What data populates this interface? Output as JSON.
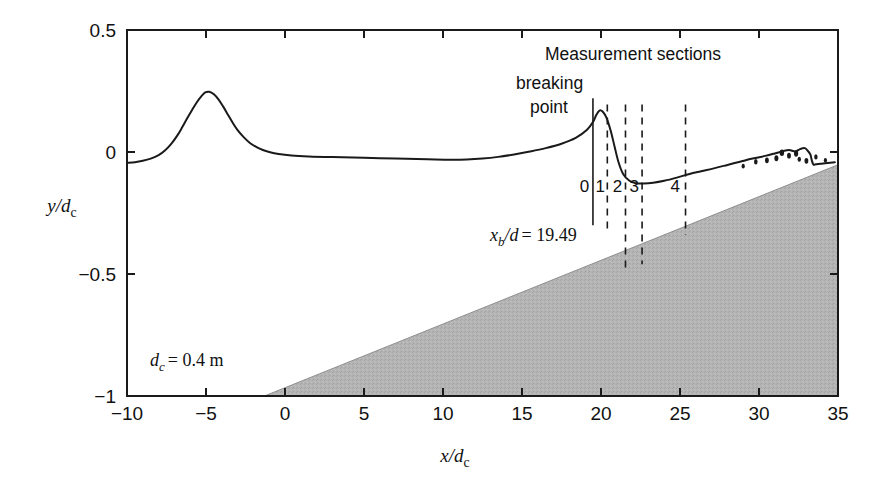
{
  "figure": {
    "background_color": "#ffffff",
    "line_color": "#1a1a1a",
    "beach_fill_color": "#b3b3b3",
    "axis_color": "#1a1a1a"
  },
  "axes": {
    "x": {
      "title_main": "x",
      "title_den": "d",
      "title_sub": "c",
      "min": -10,
      "max": 35,
      "ticks": [
        -10,
        -5,
        0,
        5,
        10,
        15,
        20,
        25,
        30,
        35
      ],
      "tick_labels": [
        "−10",
        "−5",
        "0",
        "5",
        "10",
        "15",
        "20",
        "25",
        "30",
        "35"
      ]
    },
    "y": {
      "title_main": "y",
      "title_den": "d",
      "title_sub": "c",
      "min": -1,
      "max": 0.5,
      "ticks": [
        0.5,
        0,
        -0.5,
        -1
      ],
      "tick_labels": [
        "0.5",
        "0",
        "−0.5",
        "−1"
      ]
    }
  },
  "annotations": {
    "measurement_sections": "Measurement sections",
    "breaking": "breaking",
    "point": "point",
    "xb_label_main": "x",
    "xb_label_sub": "b",
    "xb_label_rest": "/d",
    "xb_label_value": "= 19.49",
    "dc_label_main": "d",
    "dc_label_sub": "c",
    "dc_label_value": "= 0.4 m",
    "section_labels": [
      "0",
      "1",
      "2",
      "3",
      "4"
    ]
  },
  "chart_data": {
    "type": "line",
    "title": "",
    "xlabel": "x/d_c",
    "ylabel": "y/d_c",
    "xlim": [
      -10,
      35
    ],
    "ylim": [
      -1,
      0.5
    ],
    "grid": false,
    "legend": "none",
    "series": [
      {
        "name": "free-surface profile",
        "style": "solid",
        "x": [
          -10.0,
          -9.5,
          -9.0,
          -8.5,
          -8.0,
          -7.6,
          -7.2,
          -6.8,
          -6.5,
          -6.2,
          -5.9,
          -5.6,
          -5.3,
          -5.05,
          -4.8,
          -4.5,
          -4.2,
          -3.9,
          -3.6,
          -3.3,
          -3.0,
          -2.6,
          -2.2,
          -1.8,
          -1.4,
          -1.0,
          -0.4,
          0.4,
          1.5,
          3.0,
          5.0,
          7.0,
          9.0,
          10.5,
          11.5,
          12.5,
          13.5,
          14.5,
          15.5,
          16.5,
          17.5,
          18.4,
          19.1,
          19.5,
          19.7,
          19.9,
          20.1,
          20.35,
          20.6,
          20.85,
          21.1,
          21.4,
          21.8,
          22.2,
          22.7,
          23.3,
          24.0,
          24.8,
          25.6,
          26.4,
          27.2,
          28.0,
          28.8,
          29.6,
          30.4,
          31.0,
          31.5,
          31.9,
          32.3,
          32.6,
          32.9,
          33.1,
          33.25,
          33.35,
          33.45,
          33.6,
          33.9,
          34.3,
          34.8
        ],
        "y": [
          -0.045,
          -0.042,
          -0.036,
          -0.027,
          -0.013,
          0.006,
          0.033,
          0.069,
          0.102,
          0.137,
          0.17,
          0.202,
          0.228,
          0.244,
          0.247,
          0.237,
          0.215,
          0.185,
          0.152,
          0.119,
          0.09,
          0.06,
          0.036,
          0.02,
          0.008,
          0.0,
          -0.008,
          -0.014,
          -0.018,
          -0.021,
          -0.024,
          -0.027,
          -0.03,
          -0.032,
          -0.031,
          -0.027,
          -0.02,
          -0.01,
          0.002,
          0.016,
          0.034,
          0.058,
          0.09,
          0.124,
          0.152,
          0.17,
          0.166,
          0.14,
          0.09,
          0.025,
          -0.04,
          -0.09,
          -0.118,
          -0.128,
          -0.129,
          -0.126,
          -0.118,
          -0.105,
          -0.09,
          -0.078,
          -0.066,
          -0.053,
          -0.04,
          -0.027,
          -0.016,
          -0.006,
          0.003,
          0.008,
          0.002,
          0.012,
          0.016,
          0.004,
          -0.01,
          -0.036,
          -0.052,
          -0.05,
          -0.048,
          -0.045,
          -0.042
        ]
      },
      {
        "name": "beach slope",
        "style": "solid",
        "x": [
          -1.3,
          34.9
        ],
        "y": [
          -1.0,
          -0.055
        ]
      }
    ],
    "splash_droplets": [
      {
        "x": 29.0,
        "y": -0.058,
        "r": 1.6
      },
      {
        "x": 29.8,
        "y": -0.04,
        "r": 1.8
      },
      {
        "x": 30.5,
        "y": -0.034,
        "r": 1.9
      },
      {
        "x": 31.1,
        "y": -0.026,
        "r": 2.0
      },
      {
        "x": 31.45,
        "y": -0.003,
        "r": 2.2
      },
      {
        "x": 31.9,
        "y": -0.015,
        "r": 1.9
      },
      {
        "x": 32.35,
        "y": -0.006,
        "r": 2.1
      },
      {
        "x": 32.55,
        "y": -0.03,
        "r": 1.7
      },
      {
        "x": 33.0,
        "y": -0.036,
        "r": 1.9
      },
      {
        "x": 33.6,
        "y": -0.02,
        "r": 1.7
      },
      {
        "x": 34.2,
        "y": -0.034,
        "r": 1.6
      }
    ],
    "breaking_point_line": {
      "x": 19.49,
      "y_top": 0.22,
      "y_bottom": -0.3,
      "style": "solid"
    },
    "measurement_section_lines": [
      {
        "label": "1",
        "x": 20.4,
        "y_top": 0.195,
        "y_bottom": -0.33,
        "style": "dashed"
      },
      {
        "label": "2",
        "x": 21.55,
        "y_top": 0.195,
        "y_bottom": -0.48,
        "style": "dashed"
      },
      {
        "label": "3",
        "x": 22.6,
        "y_top": 0.195,
        "y_bottom": -0.46,
        "style": "dashed"
      },
      {
        "label": "4",
        "x": 25.35,
        "y_top": 0.195,
        "y_bottom": -0.34,
        "style": "dashed"
      }
    ],
    "section_number_positions": [
      {
        "label": "0",
        "x": 18.95,
        "y": -0.165
      },
      {
        "label": "1",
        "x": 19.95,
        "y": -0.165
      },
      {
        "label": "2",
        "x": 21.05,
        "y": -0.165
      },
      {
        "label": "3",
        "x": 22.1,
        "y": -0.165
      },
      {
        "label": "4",
        "x": 24.7,
        "y": -0.165
      }
    ]
  }
}
